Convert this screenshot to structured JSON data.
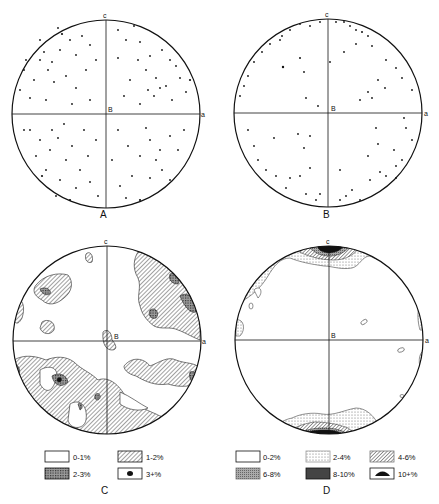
{
  "panels": [
    {
      "id": "A",
      "label": "A",
      "type": "point-diagram",
      "axes": {
        "top": "c",
        "right": "a",
        "center": "B"
      }
    },
    {
      "id": "B",
      "label": "B",
      "type": "point-diagram",
      "axes": {
        "top": "c",
        "right": "a",
        "center": "B"
      }
    },
    {
      "id": "C",
      "label": "C",
      "type": "contour-diagram",
      "axes": {
        "top": "c",
        "right": "a",
        "center": "B"
      }
    },
    {
      "id": "D",
      "label": "D",
      "type": "contour-diagram",
      "axes": {
        "top": "c",
        "right": "a",
        "center": "B"
      }
    }
  ],
  "legend_C": {
    "items": [
      {
        "label": "0-1%",
        "fill": "white"
      },
      {
        "label": "1-2%",
        "fill": "light-hatch"
      },
      {
        "label": "2-3%",
        "fill": "dark-crosshatch"
      },
      {
        "label": "3+%",
        "fill": "solid-dot"
      }
    ]
  },
  "legend_D": {
    "items": [
      {
        "label": "0-2%",
        "fill": "white"
      },
      {
        "label": "2-4%",
        "fill": "stipple"
      },
      {
        "label": "4-6%",
        "fill": "hatch"
      },
      {
        "label": "6-8%",
        "fill": "dense-hatch"
      },
      {
        "label": "8-10%",
        "fill": "dark-crosshatch"
      },
      {
        "label": "10+%",
        "fill": "solid-lens"
      }
    ]
  },
  "colors": {
    "ink": "#111111",
    "paper": "#ffffff",
    "hatch_light": "#bdbdbd",
    "hatch_dark": "#555555"
  }
}
